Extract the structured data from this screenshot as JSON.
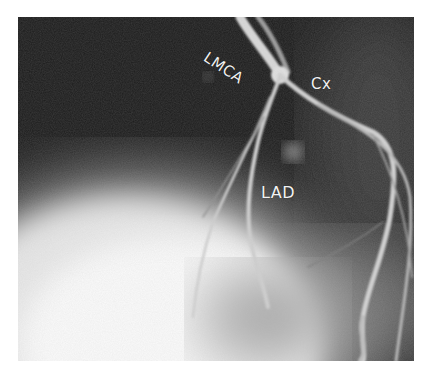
{
  "figure": {
    "labels": {
      "lmca": "LMCA",
      "cx": "Cx",
      "lad": "LAD"
    },
    "colors": {
      "background": "#ffffff",
      "dark_field": "#1a1a1a",
      "bright_field": "#f4f4f4",
      "vessel": "#cfcfcf",
      "label_text": "#f2f2f2"
    }
  }
}
